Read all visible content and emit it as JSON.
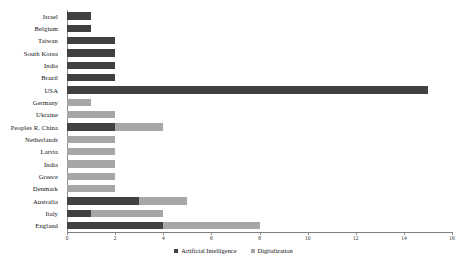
{
  "chart_data": {
    "type": "bar",
    "orientation": "horizontal",
    "stacked": true,
    "title": "",
    "xlabel": "",
    "ylabel": "",
    "xlim": [
      0,
      16
    ],
    "xticks": [
      0,
      2,
      4,
      6,
      8,
      10,
      12,
      14,
      16
    ],
    "grid": false,
    "legend_position": "bottom-center",
    "categories": [
      "Israel",
      "Belgium",
      "Taiwan",
      "South Korea",
      "India",
      "Brazil",
      "USA",
      "Germany",
      "Ukraine",
      "Peoples R. China",
      "Netherlands",
      "Latvia",
      "India",
      "Greece",
      "Denmark",
      "Australia",
      "Italy",
      "England"
    ],
    "series": [
      {
        "name": "Artificial Intelligence",
        "color": "#404040",
        "values": [
          1,
          1,
          2,
          2,
          2,
          2,
          15,
          0,
          0,
          2,
          0,
          0,
          0,
          0,
          0,
          3,
          1,
          4
        ]
      },
      {
        "name": "Digitalization",
        "color": "#a6a6a6",
        "values": [
          0,
          0,
          0,
          0,
          0,
          0,
          0,
          1,
          2,
          2,
          2,
          2,
          2,
          2,
          2,
          2,
          3,
          4
        ]
      }
    ]
  },
  "legend": {
    "items": [
      {
        "label": "Artificial Intelligence",
        "color": "#404040"
      },
      {
        "label": "Digitalization",
        "color": "#a6a6a6"
      }
    ]
  }
}
